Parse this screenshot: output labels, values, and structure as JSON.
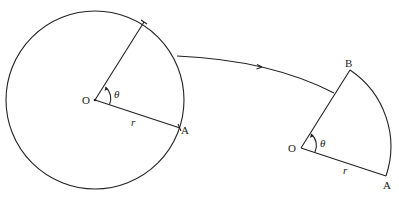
{
  "diagram": {
    "circle": {
      "center_label": "O",
      "point_label": "A",
      "radius_label": "r",
      "angle_label": "θ"
    },
    "sector": {
      "center_label": "O",
      "point_a_label": "A",
      "point_b_label": "B",
      "radius_label": "r",
      "angle_label": "θ"
    },
    "connector": "arrow-curve"
  }
}
